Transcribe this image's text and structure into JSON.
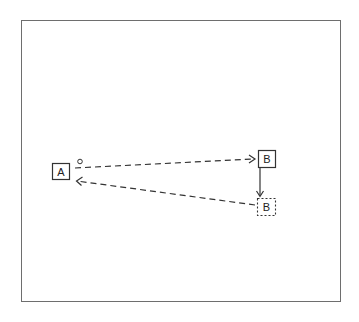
{
  "diagram": {
    "frame": {
      "x": 21,
      "y": 20,
      "width": 320,
      "height": 282
    },
    "nodes": [
      {
        "id": "A",
        "label": "A",
        "style": "solid",
        "x": 52,
        "y": 163,
        "w": 17,
        "h": 16
      },
      {
        "id": "B",
        "label": "B",
        "style": "solid",
        "x": 258,
        "y": 150,
        "w": 17,
        "h": 17
      },
      {
        "id": "B2",
        "label": "B",
        "style": "dotted",
        "x": 257,
        "y": 198,
        "w": 18,
        "h": 17
      }
    ],
    "edges": [
      {
        "from": "A",
        "to": "B",
        "style": "dashed",
        "start_marker": "circle",
        "end_marker": "open-arrow"
      },
      {
        "from": "B",
        "to": "B2",
        "style": "solid",
        "end_marker": "open-arrow"
      },
      {
        "from": "B2",
        "to": "A",
        "style": "dashed",
        "end_marker": "open-arrow"
      }
    ],
    "colors": {
      "stroke": "#333333",
      "frame": "#6e6e6e",
      "background": "#ffffff"
    }
  }
}
